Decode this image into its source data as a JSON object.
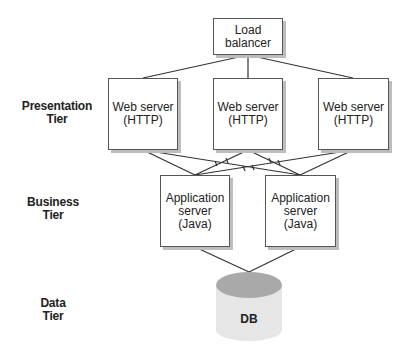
{
  "tiers": {
    "presentation": [
      "Presentation",
      "Tier"
    ],
    "business": [
      "Business",
      "Tier"
    ],
    "data": [
      "Data",
      "Tier"
    ]
  },
  "nodes": {
    "load_balancer": [
      "Load",
      "balancer"
    ],
    "web_servers": [
      [
        "Web server",
        "(HTTP)"
      ],
      [
        "Web server",
        "(HTTP)"
      ],
      [
        "Web server",
        "(HTTP)"
      ]
    ],
    "app_servers": [
      [
        "Application",
        "server",
        "(Java)"
      ],
      [
        "Application",
        "server",
        "(Java)"
      ]
    ],
    "database": "DB"
  },
  "colors": {
    "line": "#333333",
    "box_border": "#555555",
    "shadow": "#bdbdbd",
    "db_top": "#a9a9a9",
    "db_body": "#e6e6e6"
  }
}
